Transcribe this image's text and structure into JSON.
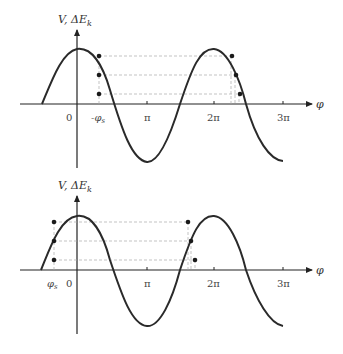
{
  "diagrams": [
    {
      "id": "top",
      "y_label": "V, ΔE_k",
      "x_label": "φ",
      "ticks": [
        "0",
        "-φs",
        "π",
        "2π",
        "3π"
      ],
      "stable_phase_label": "-φs",
      "dots_left": 3,
      "dots_right": 3
    },
    {
      "id": "bottom",
      "y_label": "V, ΔE_k",
      "x_label": "φ",
      "ticks": [
        "φs",
        "0",
        "π",
        "2π",
        "3π"
      ],
      "stable_phase_label": "φs",
      "dots_left": 3,
      "dots_right": 3
    }
  ],
  "labels": {
    "top_ylabel_main": "V, ΔE",
    "top_ylabel_sub": "k",
    "top_xlabel": "φ",
    "top_tick_0": "0",
    "top_tick_phis": "-φ",
    "top_tick_phis_sub": "s",
    "top_tick_pi": "π",
    "top_tick_2pi": "2π",
    "top_tick_3pi": "3π",
    "bot_ylabel_main": "V, ΔE",
    "bot_ylabel_sub": "k",
    "bot_xlabel": "φ",
    "bot_tick_phis": "φ",
    "bot_tick_phis_sub": "s",
    "bot_tick_0": "0",
    "bot_tick_pi": "π",
    "bot_tick_2pi": "2π",
    "bot_tick_3pi": "3π"
  },
  "colors": {
    "curve": "#2a2a2a",
    "axis": "#222222",
    "dashed": "#999999",
    "dot": "#1a1a1a"
  }
}
